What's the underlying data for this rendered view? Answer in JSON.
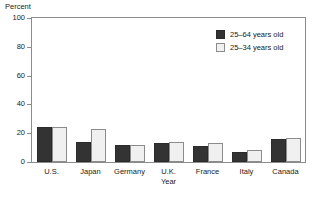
{
  "chart_data": {
    "type": "bar",
    "title": "",
    "xlabel": "Year",
    "ylabel": "Percent",
    "ylim": [
      0,
      100
    ],
    "yticks": [
      0,
      20,
      40,
      60,
      80,
      100
    ],
    "grid": false,
    "legend_position": "top-right",
    "categories": [
      "U.S.",
      "Japan",
      "Germany",
      "U.K.",
      "France",
      "Italy",
      "Canada"
    ],
    "series": [
      {
        "name": "25–64 years old",
        "color": "#333333",
        "values": [
          24,
          14,
          12,
          13,
          11,
          7,
          16
        ]
      },
      {
        "name": "25–34 years old",
        "color": "#f0f0f0",
        "values": [
          24,
          23,
          12,
          14,
          13,
          8,
          17
        ]
      }
    ]
  },
  "axis": {
    "y_title": "Percent",
    "y_tick_labels": [
      "100",
      "80",
      "60",
      "40",
      "20",
      "0"
    ],
    "x_sub_label": "Year"
  },
  "legend": {
    "items": [
      {
        "label": "25–64 years old"
      },
      {
        "label": "25–34 years old"
      }
    ]
  }
}
